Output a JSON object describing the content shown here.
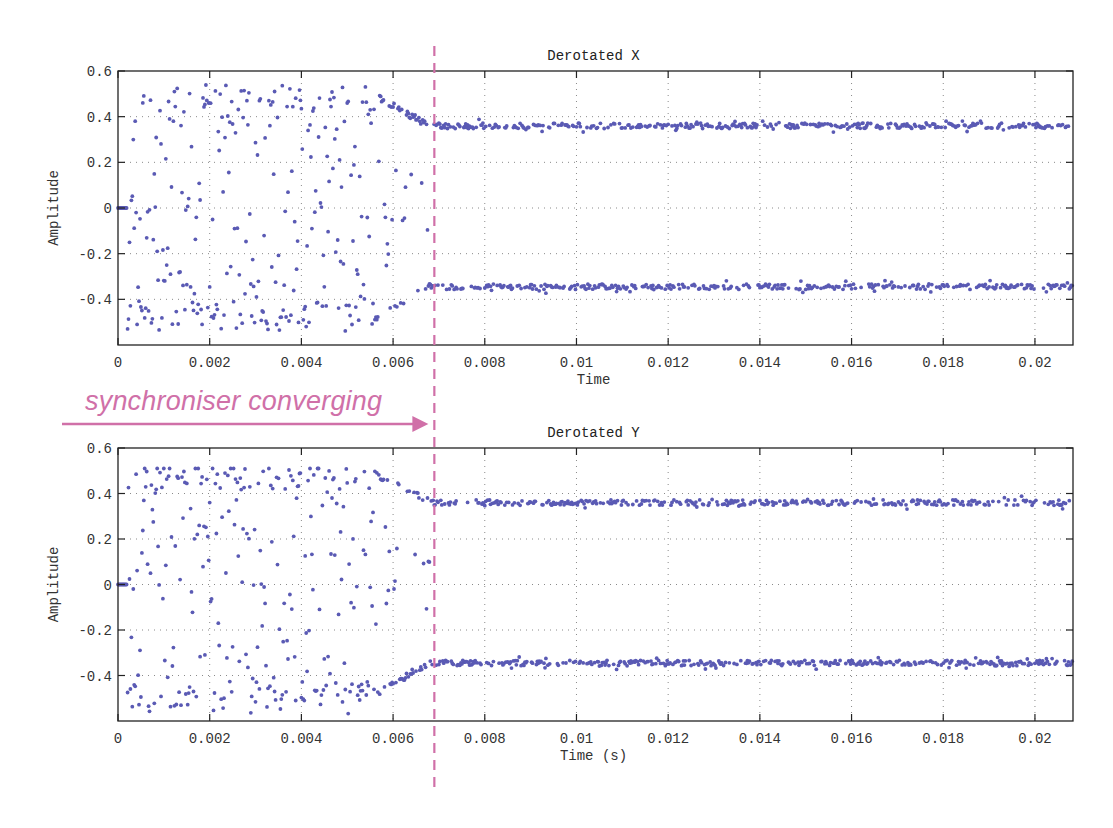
{
  "chart_data": [
    {
      "type": "scatter",
      "title": "Derotated X",
      "xlabel": "Time",
      "ylabel": "Amplitude",
      "xlim": [
        0,
        0.02083
      ],
      "ylim": [
        -0.6,
        0.6
      ],
      "xticks": [
        0,
        0.002,
        0.004,
        0.006,
        0.008,
        0.01,
        0.012,
        0.014,
        0.016,
        0.018,
        0.02
      ],
      "xtick_labels": [
        "0",
        "0.002",
        "0.004",
        "0.006",
        "0.008",
        "0.01",
        "0.012",
        "0.014",
        "0.016",
        "0.018",
        "0.02"
      ],
      "yticks": [
        0.6,
        0.4,
        0.2,
        0,
        -0.2,
        -0.4
      ],
      "ytick_labels": [
        "0.6",
        "0.4",
        "0.2",
        "0",
        "-0.2",
        "-0.4"
      ],
      "grid": true,
      "series": [
        {
          "name": "Derotated X samples",
          "color": "#5a5ab4",
          "initial_zero_until": 0.0002,
          "transient_end": 0.0068,
          "transient_amplitude_range": [
            -0.54,
            0.54
          ],
          "converged_levels": [
            0.36,
            -0.345
          ],
          "converged_noise": 0.012,
          "points_per_ms": 48,
          "seed": 7
        }
      ]
    },
    {
      "type": "scatter",
      "title": "Derotated Y",
      "xlabel": "Time (s)",
      "ylabel": "Amplitude",
      "xlim": [
        0,
        0.02083
      ],
      "ylim": [
        -0.6,
        0.6
      ],
      "xticks": [
        0,
        0.002,
        0.004,
        0.006,
        0.008,
        0.01,
        0.012,
        0.014,
        0.016,
        0.018,
        0.02
      ],
      "xtick_labels": [
        "0",
        "0.002",
        "0.004",
        "0.006",
        "0.008",
        "0.01",
        "0.012",
        "0.014",
        "0.016",
        "0.018",
        "0.02"
      ],
      "yticks": [
        0.6,
        0.4,
        0.2,
        0,
        -0.2,
        -0.4
      ],
      "ytick_labels": [
        "0.6",
        "0.4",
        "0.2",
        "0",
        "-0.2",
        "-0.4"
      ],
      "grid": true,
      "series": [
        {
          "name": "Derotated Y samples",
          "color": "#5a5ab4",
          "initial_zero_until": 0.0002,
          "transient_end": 0.0068,
          "transient_amplitude_range": [
            -0.57,
            0.51
          ],
          "converged_levels": [
            0.36,
            -0.345
          ],
          "converged_noise": 0.012,
          "points_per_ms": 48,
          "seed": 13
        }
      ]
    }
  ],
  "annotation": {
    "text": "synchroniser converging",
    "color": "#d070a8",
    "marker_time": 0.0069
  }
}
